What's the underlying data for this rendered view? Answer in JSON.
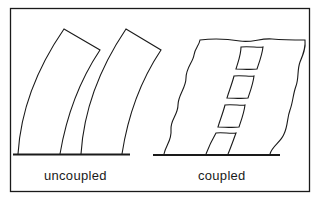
{
  "figure": {
    "panels": [
      {
        "id": "left",
        "label": "uncoupled"
      },
      {
        "id": "right",
        "label": "coupled"
      }
    ]
  },
  "colors": {
    "stroke": "#1a1a1a",
    "background": "#ffffff"
  }
}
